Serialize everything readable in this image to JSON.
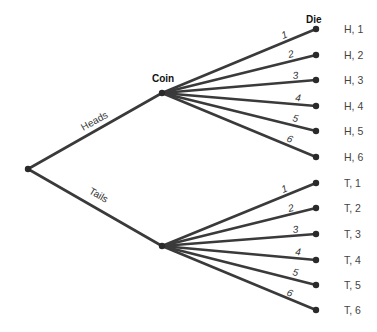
{
  "headers": {
    "coin": "Coin",
    "die": "Die"
  },
  "branches": {
    "heads": "Heads",
    "tails": "Tails"
  },
  "die_faces": [
    "1",
    "2",
    "3",
    "4",
    "5",
    "6"
  ],
  "outcomes": {
    "heads": [
      "H, 1",
      "H, 2",
      "H, 3",
      "H, 4",
      "H, 5",
      "H, 6"
    ],
    "tails": [
      "T, 1",
      "T, 2",
      "T, 3",
      "T, 4",
      "T, 5",
      "T, 6"
    ]
  },
  "colors": {
    "edge": "#3a3a3a",
    "node": "#2a2a2a",
    "text": "#333333"
  }
}
